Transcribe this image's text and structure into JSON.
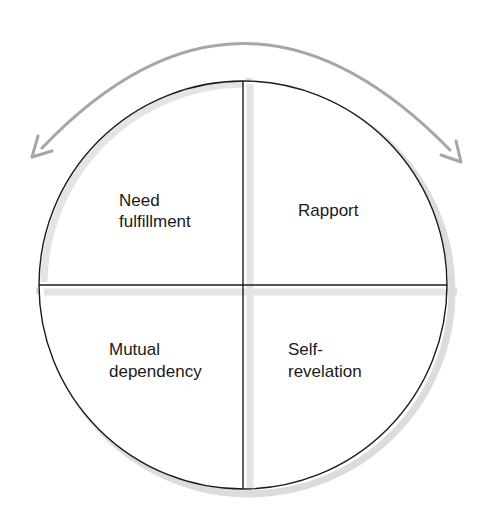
{
  "diagram": {
    "type": "wheel",
    "quadrants": [
      {
        "position": "top-left",
        "lines": [
          "Need",
          "fulfillment"
        ]
      },
      {
        "position": "top-right",
        "lines": [
          "Rapport"
        ]
      },
      {
        "position": "bottom-left",
        "lines": [
          "Mutual",
          "dependency"
        ]
      },
      {
        "position": "bottom-right",
        "lines": [
          "Self-",
          "revelation"
        ]
      }
    ],
    "cycle_arrow": {
      "direction": "bidirectional",
      "icon": "curved-double-arrow-icon"
    },
    "colors": {
      "outline": "#1a1a1a",
      "shadow": "#d9d9d9",
      "arrow": "#a6a6a6",
      "text": "#1a1a1a"
    }
  }
}
